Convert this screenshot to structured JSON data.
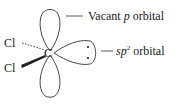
{
  "diagram": {
    "central_atom": "C",
    "substituents": [
      {
        "label": "Cl",
        "bond": "dashed"
      },
      {
        "label": "Cl",
        "bond": "wedge"
      }
    ],
    "labels": {
      "vacant_p_prefix": "Vacant ",
      "vacant_p_italic": "p",
      "vacant_p_suffix": " orbital",
      "sp2_italic": "sp",
      "sp2_sup": "2",
      "sp2_suffix": " orbital"
    },
    "lone_pair_dots": 2,
    "colors": {
      "line": "#333333",
      "background": "#ffffff"
    }
  }
}
